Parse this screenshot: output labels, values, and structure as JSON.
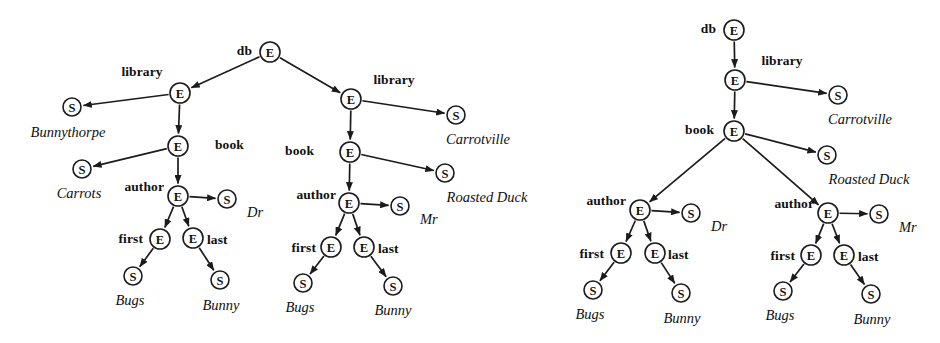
{
  "figure": {
    "background_color": "#ffffff",
    "ink_color": "#1b1b1b",
    "node_glyphs": {
      "element": "E",
      "string": "S"
    }
  },
  "diagrams": [
    {
      "id": "left-tree",
      "name": "two-library-xml-tree",
      "nodes": [
        {
          "id": "L-db",
          "glyph": "E",
          "x": 270,
          "y": 52,
          "r": 10
        },
        {
          "id": "L-lib1",
          "glyph": "E",
          "x": 180,
          "y": 93,
          "r": 10
        },
        {
          "id": "L-lib1-name",
          "glyph": "S",
          "x": 72,
          "y": 107,
          "r": 9
        },
        {
          "id": "L-book1",
          "glyph": "E",
          "x": 178,
          "y": 146,
          "r": 10
        },
        {
          "id": "L-book1-t",
          "glyph": "S",
          "x": 82,
          "y": 169,
          "r": 9
        },
        {
          "id": "L-auth1",
          "glyph": "E",
          "x": 178,
          "y": 196,
          "r": 10
        },
        {
          "id": "L-auth1-ttl",
          "glyph": "S",
          "x": 227,
          "y": 199,
          "r": 9
        },
        {
          "id": "L-first1",
          "glyph": "E",
          "x": 160,
          "y": 239,
          "r": 10
        },
        {
          "id": "L-last1",
          "glyph": "E",
          "x": 193,
          "y": 238,
          "r": 10
        },
        {
          "id": "L-first1-v",
          "glyph": "S",
          "x": 133,
          "y": 276,
          "r": 9
        },
        {
          "id": "L-last1-v",
          "glyph": "S",
          "x": 220,
          "y": 280,
          "r": 9
        },
        {
          "id": "L-lib2",
          "glyph": "E",
          "x": 351,
          "y": 99,
          "r": 10
        },
        {
          "id": "L-lib2-name",
          "glyph": "S",
          "x": 456,
          "y": 115,
          "r": 9
        },
        {
          "id": "L-book2",
          "glyph": "E",
          "x": 350,
          "y": 152,
          "r": 10
        },
        {
          "id": "L-book2-t",
          "glyph": "S",
          "x": 445,
          "y": 173,
          "r": 9
        },
        {
          "id": "L-auth2",
          "glyph": "E",
          "x": 349,
          "y": 203,
          "r": 10
        },
        {
          "id": "L-auth2-ttl",
          "glyph": "S",
          "x": 400,
          "y": 206,
          "r": 9
        },
        {
          "id": "L-first2",
          "glyph": "E",
          "x": 331,
          "y": 247,
          "r": 10
        },
        {
          "id": "L-last2",
          "glyph": "E",
          "x": 364,
          "y": 247,
          "r": 10
        },
        {
          "id": "L-first2-v",
          "glyph": "S",
          "x": 303,
          "y": 283,
          "r": 9
        },
        {
          "id": "L-last2-v",
          "glyph": "S",
          "x": 393,
          "y": 286,
          "r": 9
        }
      ],
      "edges": [
        {
          "from": "L-db",
          "to": "L-lib1"
        },
        {
          "from": "L-db",
          "to": "L-lib2"
        },
        {
          "from": "L-lib1",
          "to": "L-lib1-name"
        },
        {
          "from": "L-lib1",
          "to": "L-book1"
        },
        {
          "from": "L-book1",
          "to": "L-book1-t"
        },
        {
          "from": "L-book1",
          "to": "L-auth1"
        },
        {
          "from": "L-auth1",
          "to": "L-auth1-ttl"
        },
        {
          "from": "L-auth1",
          "to": "L-first1"
        },
        {
          "from": "L-auth1",
          "to": "L-last1"
        },
        {
          "from": "L-first1",
          "to": "L-first1-v"
        },
        {
          "from": "L-last1",
          "to": "L-last1-v"
        },
        {
          "from": "L-lib2",
          "to": "L-lib2-name"
        },
        {
          "from": "L-lib2",
          "to": "L-book2"
        },
        {
          "from": "L-book2",
          "to": "L-book2-t"
        },
        {
          "from": "L-book2",
          "to": "L-auth2"
        },
        {
          "from": "L-auth2",
          "to": "L-auth2-ttl"
        },
        {
          "from": "L-auth2",
          "to": "L-first2"
        },
        {
          "from": "L-auth2",
          "to": "L-last2"
        },
        {
          "from": "L-first2",
          "to": "L-first2-v"
        },
        {
          "from": "L-last2",
          "to": "L-last2-v"
        }
      ],
      "tag_labels": [
        {
          "text": "db",
          "x": 252,
          "y": 52,
          "align": "end"
        },
        {
          "text": "library",
          "x": 142,
          "y": 73,
          "align": "mid"
        },
        {
          "text": "library",
          "x": 394,
          "y": 81,
          "align": "mid"
        },
        {
          "text": "book",
          "x": 215,
          "y": 146,
          "align": "start"
        },
        {
          "text": "book",
          "x": 314,
          "y": 152,
          "align": "end"
        },
        {
          "text": "author",
          "x": 164,
          "y": 188,
          "align": "end"
        },
        {
          "text": "author",
          "x": 336,
          "y": 196,
          "align": "end"
        },
        {
          "text": "first",
          "x": 143,
          "y": 240,
          "align": "end"
        },
        {
          "text": "last",
          "x": 207,
          "y": 241,
          "align": "start"
        },
        {
          "text": "first",
          "x": 316,
          "y": 249,
          "align": "end"
        },
        {
          "text": "last",
          "x": 378,
          "y": 250,
          "align": "start"
        }
      ],
      "value_labels": [
        {
          "text": "Bunnythorpe",
          "x": 68,
          "y": 133,
          "align": "mid"
        },
        {
          "text": "Carrots",
          "x": 79,
          "y": 194,
          "align": "mid"
        },
        {
          "text": "Dr",
          "x": 247,
          "y": 213,
          "align": "start"
        },
        {
          "text": "Bugs",
          "x": 130,
          "y": 301,
          "align": "mid"
        },
        {
          "text": "Bunny",
          "x": 221,
          "y": 306,
          "align": "mid"
        },
        {
          "text": "Carrotville",
          "x": 478,
          "y": 140,
          "align": "mid"
        },
        {
          "text": "Roasted Duck",
          "x": 487,
          "y": 198,
          "align": "mid"
        },
        {
          "text": "Mr",
          "x": 420,
          "y": 220,
          "align": "start"
        },
        {
          "text": "Bugs",
          "x": 300,
          "y": 308,
          "align": "mid"
        },
        {
          "text": "Bunny",
          "x": 393,
          "y": 311,
          "align": "mid"
        }
      ]
    },
    {
      "id": "right-tree",
      "name": "single-library-merged-xml-tree",
      "nodes": [
        {
          "id": "R-db",
          "glyph": "E",
          "x": 734,
          "y": 30,
          "r": 10
        },
        {
          "id": "R-lib",
          "glyph": "E",
          "x": 735,
          "y": 80,
          "r": 10
        },
        {
          "id": "R-lib-name",
          "glyph": "S",
          "x": 838,
          "y": 95,
          "r": 9
        },
        {
          "id": "R-book",
          "glyph": "E",
          "x": 734,
          "y": 131,
          "r": 10
        },
        {
          "id": "R-book-t",
          "glyph": "S",
          "x": 827,
          "y": 155,
          "r": 9
        },
        {
          "id": "R-auth1",
          "glyph": "E",
          "x": 640,
          "y": 210,
          "r": 10
        },
        {
          "id": "R-auth1-ttl",
          "glyph": "S",
          "x": 691,
          "y": 213,
          "r": 9
        },
        {
          "id": "R-first1",
          "glyph": "E",
          "x": 621,
          "y": 253,
          "r": 10
        },
        {
          "id": "R-last1",
          "glyph": "E",
          "x": 655,
          "y": 253,
          "r": 10
        },
        {
          "id": "R-first1-v",
          "glyph": "S",
          "x": 593,
          "y": 290,
          "r": 9
        },
        {
          "id": "R-last1-v",
          "glyph": "S",
          "x": 681,
          "y": 293,
          "r": 9
        },
        {
          "id": "R-auth2",
          "glyph": "E",
          "x": 828,
          "y": 213,
          "r": 10
        },
        {
          "id": "R-auth2-ttl",
          "glyph": "S",
          "x": 879,
          "y": 214,
          "r": 9
        },
        {
          "id": "R-first2",
          "glyph": "E",
          "x": 811,
          "y": 255,
          "r": 10
        },
        {
          "id": "R-last2",
          "glyph": "E",
          "x": 844,
          "y": 255,
          "r": 10
        },
        {
          "id": "R-first2-v",
          "glyph": "S",
          "x": 783,
          "y": 291,
          "r": 9
        },
        {
          "id": "R-last2-v",
          "glyph": "S",
          "x": 871,
          "y": 294,
          "r": 9
        }
      ],
      "edges": [
        {
          "from": "R-db",
          "to": "R-lib"
        },
        {
          "from": "R-lib",
          "to": "R-lib-name"
        },
        {
          "from": "R-lib",
          "to": "R-book"
        },
        {
          "from": "R-book",
          "to": "R-book-t"
        },
        {
          "from": "R-book",
          "to": "R-auth1"
        },
        {
          "from": "R-book",
          "to": "R-auth2"
        },
        {
          "from": "R-auth1",
          "to": "R-auth1-ttl"
        },
        {
          "from": "R-auth1",
          "to": "R-first1"
        },
        {
          "from": "R-auth1",
          "to": "R-last1"
        },
        {
          "from": "R-first1",
          "to": "R-first1-v"
        },
        {
          "from": "R-last1",
          "to": "R-last1-v"
        },
        {
          "from": "R-auth2",
          "to": "R-auth2-ttl"
        },
        {
          "from": "R-auth2",
          "to": "R-first2"
        },
        {
          "from": "R-auth2",
          "to": "R-last2"
        },
        {
          "from": "R-first2",
          "to": "R-first2-v"
        },
        {
          "from": "R-last2",
          "to": "R-last2-v"
        }
      ],
      "tag_labels": [
        {
          "text": "db",
          "x": 716,
          "y": 30,
          "align": "end"
        },
        {
          "text": "library",
          "x": 782,
          "y": 62,
          "align": "mid"
        },
        {
          "text": "book",
          "x": 714,
          "y": 131,
          "align": "end"
        },
        {
          "text": "author",
          "x": 626,
          "y": 202,
          "align": "end"
        },
        {
          "text": "author",
          "x": 814,
          "y": 205,
          "align": "end"
        },
        {
          "text": "first",
          "x": 604,
          "y": 255,
          "align": "end"
        },
        {
          "text": "last",
          "x": 668,
          "y": 256,
          "align": "start"
        },
        {
          "text": "first",
          "x": 795,
          "y": 257,
          "align": "end"
        },
        {
          "text": "last",
          "x": 858,
          "y": 258,
          "align": "start"
        }
      ],
      "value_labels": [
        {
          "text": "Carrotville",
          "x": 860,
          "y": 120,
          "align": "mid"
        },
        {
          "text": "Roasted Duck",
          "x": 869,
          "y": 180,
          "align": "mid"
        },
        {
          "text": "Dr",
          "x": 711,
          "y": 227,
          "align": "start"
        },
        {
          "text": "Mr",
          "x": 899,
          "y": 228,
          "align": "start"
        },
        {
          "text": "Bugs",
          "x": 590,
          "y": 315,
          "align": "mid"
        },
        {
          "text": "Bunny",
          "x": 682,
          "y": 319,
          "align": "mid"
        },
        {
          "text": "Bugs",
          "x": 780,
          "y": 316,
          "align": "mid"
        },
        {
          "text": "Bunny",
          "x": 872,
          "y": 320,
          "align": "mid"
        }
      ]
    }
  ]
}
